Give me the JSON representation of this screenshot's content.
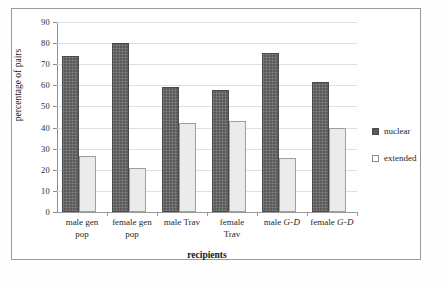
{
  "chart_data": {
    "type": "bar",
    "title": "",
    "xlabel": "recipients",
    "ylabel": "percentage of pairs",
    "ylim": [
      0,
      90
    ],
    "ytick_step": 10,
    "yticks": [
      "0",
      "10",
      "20",
      "30",
      "40",
      "50",
      "60",
      "70",
      "80",
      "90"
    ],
    "grid": true,
    "legend_position": "right",
    "categories": [
      "male gen pop",
      "female gen pop",
      "male Trav",
      "female Trav",
      "male G-D",
      "female G-D"
    ],
    "category_lines": [
      [
        "male gen",
        "pop"
      ],
      [
        "female gen",
        "pop"
      ],
      [
        "male Trav"
      ],
      [
        "female",
        "Trav"
      ],
      [
        "male ",
        "G-D"
      ],
      [
        "female ",
        "G-D"
      ]
    ],
    "series": [
      {
        "name": "nuclear",
        "color": "#5a5a5a",
        "values": [
          74,
          80,
          59,
          58,
          75.5,
          61.5
        ]
      },
      {
        "name": "extended",
        "color": "#ebebeb",
        "values": [
          26.5,
          21,
          42,
          43,
          25.5,
          40
        ]
      }
    ]
  },
  "legend": {
    "items": [
      {
        "label": "nuclear",
        "swatch": "filled-dark-square"
      },
      {
        "label": "extended",
        "swatch": "outlined-white-square"
      }
    ]
  },
  "axes": {
    "x_title": "recipients",
    "y_title": "percentage of pairs"
  }
}
